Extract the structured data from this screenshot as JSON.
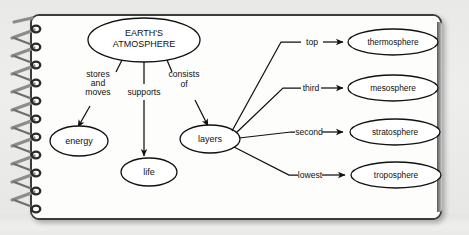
{
  "notebook": {
    "binding": "spiral-wire",
    "page_color": "#fdfdfc",
    "border_color": "#3b3b3b",
    "background_color": "#ececea"
  },
  "diagram": {
    "type": "concept-map",
    "root": {
      "id": "root",
      "label_line1": "EARTH'S",
      "label_line2": "ATMOSPHERE"
    },
    "nodes": [
      {
        "id": "energy",
        "label": "energy"
      },
      {
        "id": "life",
        "label": "life"
      },
      {
        "id": "layers",
        "label": "layers"
      },
      {
        "id": "thermosphere",
        "label": "thermosphere"
      },
      {
        "id": "mesosphere",
        "label": "mesosphere"
      },
      {
        "id": "stratosphere",
        "label": "stratosphere"
      },
      {
        "id": "troposphere",
        "label": "troposphere"
      }
    ],
    "root_links": [
      {
        "id": "stores-and-moves",
        "line1": "stores",
        "line2": "and",
        "line3": "moves",
        "to": "energy"
      },
      {
        "id": "supports",
        "line1": "supports",
        "to": "life"
      },
      {
        "id": "consists-of",
        "line1": "consists",
        "line2": "of",
        "to": "layers"
      }
    ],
    "layer_links": [
      {
        "id": "top",
        "label": "top",
        "to": "thermosphere"
      },
      {
        "id": "third",
        "label": "third",
        "to": "mesosphere"
      },
      {
        "id": "second",
        "label": "second",
        "to": "stratosphere"
      },
      {
        "id": "lowest",
        "label": "lowest",
        "to": "troposphere"
      }
    ]
  }
}
